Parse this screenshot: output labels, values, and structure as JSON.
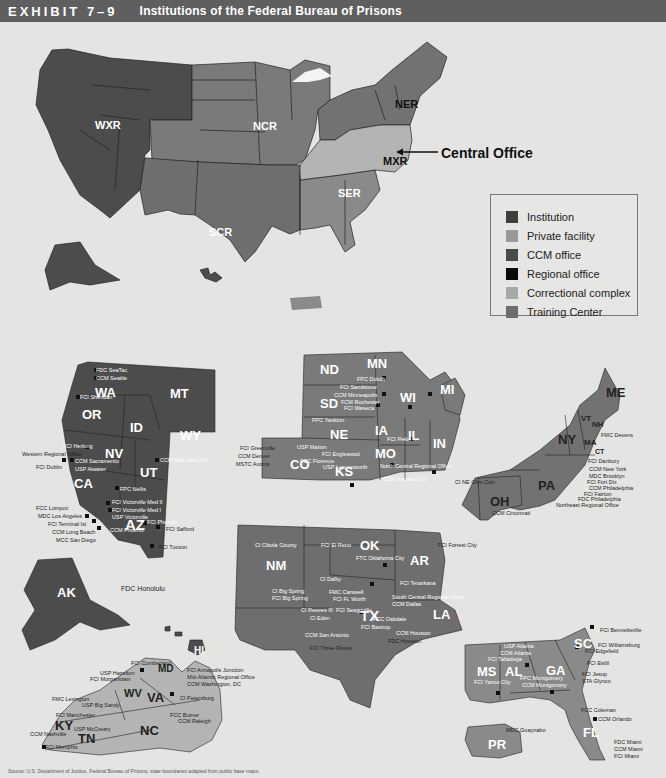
{
  "header": {
    "exhibit": "EXHIBIT 7–9",
    "title": "Institutions of the Federal Bureau of Prisons"
  },
  "callout": {
    "central_office": "Central Office"
  },
  "regions": {
    "wxr": "WXR",
    "ncr": "NCR",
    "scr": "SCR",
    "ser": "SER",
    "ner": "NER",
    "mxr": "MXR"
  },
  "legend": {
    "items": [
      {
        "label": "Institution",
        "color": "#3e3e3e"
      },
      {
        "label": "Private facility",
        "color": "#9a9a9a"
      },
      {
        "label": "CCM office",
        "color": "#4a4a4a"
      },
      {
        "label": "Regional office",
        "color": "#0a0a0a"
      },
      {
        "label": "Correctional complex",
        "color": "#a8a8a8"
      },
      {
        "label": "Training Center",
        "color": "#6e6e6e"
      }
    ]
  },
  "colors": {
    "wxr": "#4c4c4c",
    "ncr": "#7a7a7a",
    "scr": "#6e6e6e",
    "ser": "#8a8a8a",
    "ner": "#727272",
    "mxr": "#b4b4b4",
    "background": "#e4e4e2",
    "title_bar": "#5f5f5f"
  },
  "states": {
    "west": [
      "WA",
      "OR",
      "ID",
      "MT",
      "WY",
      "NV",
      "UT",
      "CA",
      "AZ",
      "AK",
      "HI"
    ],
    "north_central": [
      "ND",
      "MN",
      "SD",
      "WI",
      "MI",
      "NE",
      "IA",
      "IL",
      "IN",
      "CO",
      "KS",
      "MO"
    ],
    "south_central": [
      "NM",
      "OK",
      "AR",
      "TX",
      "LA"
    ],
    "northeast": [
      "ME",
      "NY",
      "VT",
      "NH",
      "MA",
      "CT",
      "PA",
      "OH"
    ],
    "mid_atlantic": [
      "MD",
      "WV",
      "VA",
      "KY",
      "TN",
      "NC"
    ],
    "southeast": [
      "MS",
      "AL",
      "GA",
      "SC",
      "FL",
      "PR"
    ]
  },
  "facilities": {
    "west": [
      "FDC SeaTac",
      "CCM Seattle",
      "FCI Sheridan",
      "FCI Herlong",
      "Western Regional Office",
      "FCI Dublin",
      "CCM Sacramento",
      "USP Atwater",
      "CCM Salt Lake City",
      "FPC Nellis",
      "CI California City",
      "CI Taft",
      "FCC Lompoc",
      "FCI Victorville Med II",
      "FCI Victorville Med I",
      "USP Victorville",
      "MDC Los Angeles",
      "FCI Terminal Isl",
      "CCM Long Beach",
      "MCC San Diego",
      "FCI Phoenix",
      "CCM Phoenix",
      "FCI Safford",
      "FCI Tucson",
      "FDC Honolulu"
    ],
    "north_central": [
      "FPC Duluth",
      "FCI Sandstone",
      "CCM Minneapolis",
      "FCM Rochester",
      "FCI Waseca",
      "FCI Oxford",
      "CCM Detroit",
      "FCI Milan",
      "MCC Chicago",
      "CCM Chicago",
      "FPC Yankton",
      "FCI Pekin",
      "FCC Terre Haute",
      "FCI Greenville",
      "USP Marion",
      "CCM Denver",
      "MSTC Aurora",
      "FCI Englewood",
      "FCC Florence",
      "USP Leavenworth",
      "North Central Regional Office",
      "CCM Kansas City",
      "CCM St. Louis",
      "USMCFP Springfield"
    ],
    "south_central": [
      "CI Cibola County",
      "FCI El Reno",
      "FTC Oklahoma City",
      "FCI Forrest City",
      "CI Dalby",
      "FCI Texarkana",
      "CI Big Spring",
      "FCI Big Spring",
      "FMC Carswell",
      "FCI Ft. Worth",
      "South Central Regional Office",
      "CCM Dallas",
      "FPC La Tuna",
      "CCM El Paso",
      "CI Reeves I & II",
      "CI Reeves III",
      "FCI Seagoville",
      "CI Eden",
      "USP Pollock",
      "FCC Oakdale",
      "FPC Bryan",
      "FCI Bastrop",
      "FCC Beaumont",
      "CCM New Orleans",
      "CCM San Antonio",
      "CCM Houston",
      "FDC Houston",
      "FCI Three Rivers"
    ],
    "northeast": [
      "FCI Ray Brook",
      "FMC Devens",
      "FCI Danbury",
      "CCM New York",
      "MCC New York",
      "MDC Brooklyn",
      "FCI Otisville",
      "USP Canaan",
      "FCI McKean",
      "CI NE Ohio Corr",
      "FCI Elkton",
      "FCI Loretto",
      "CCM Pittsburgh",
      "CCM Cincinnati",
      "FCI Fort Dix",
      "CCM Philadelphia",
      "FCI Fairton",
      "FDC Philadelphia",
      "Northeast Regional Office",
      "USP Lewisburg",
      "FCI Schuylkill"
    ],
    "mid_atlantic": [
      "FCI Cumberland",
      "USP Hazelton",
      "FCI Morgantown",
      "FCI Gilmer",
      "FCI Annapolis Junction",
      "Mid-Atlantic Regional Office",
      "CCM Washington, DC",
      "FCI Ashland",
      "FCI Beckley",
      "FMC Lexington",
      "USP Big Sandy",
      "FCI Alderson",
      "CI Petersburg",
      "CI Rivers",
      "FCC Butner",
      "CCM Raleigh",
      "FCI Manchester",
      "USP Lee",
      "USP McCreary",
      "CCM Nashville",
      "FCI Memphis"
    ],
    "southeast": [
      "Southeast Regional Office",
      "USP Atlanta",
      "CCM Atlanta",
      "FCI Talladega",
      "CI McRae",
      "FCI Bennettsville",
      "FCI Williamsburg",
      "FCI Edgefield",
      "FCI Estill",
      "FCI Yazoo City",
      "FPC Montgomery",
      "CCM Montgomery",
      "FCI Jesup",
      "STA Glynco",
      "FCI Tallahassee",
      "FPC Pensacola",
      "FCI Marianna",
      "FCC Coleman",
      "CCM Orlando",
      "MDC Guaynabo",
      "FDC Miami",
      "CCM Miami",
      "FCI Miami"
    ]
  },
  "footer": {
    "source": "Source: U.S. Department of Justice, Federal Bureau of Prisons; state boundaries adapted from public base maps."
  }
}
